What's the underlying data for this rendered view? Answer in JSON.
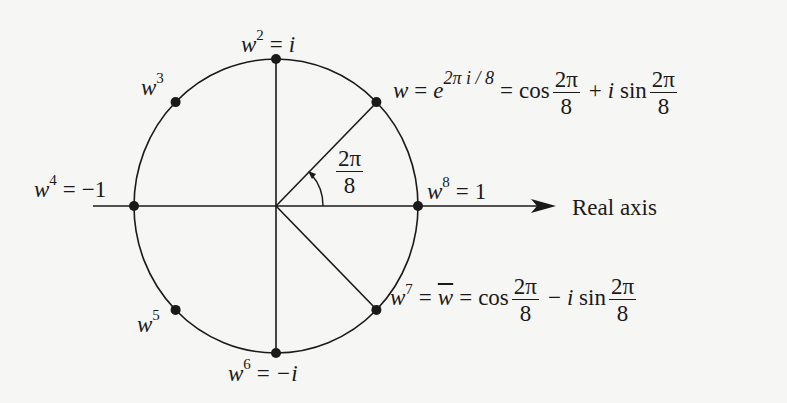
{
  "diagram": {
    "axis_label": "Real axis",
    "angle_label": {
      "num": "2π",
      "den": "8"
    },
    "points": [
      {
        "id": "w8",
        "k": 8,
        "base": "w",
        "exp": "8",
        "value": "1"
      },
      {
        "id": "w1",
        "k": 1,
        "base": "w",
        "exp": "",
        "value": "e",
        "value_exp": "2π i / 8"
      },
      {
        "id": "w2",
        "k": 2,
        "base": "w",
        "exp": "2",
        "value": "i"
      },
      {
        "id": "w3",
        "k": 3,
        "base": "w",
        "exp": "3",
        "value": ""
      },
      {
        "id": "w4",
        "k": 4,
        "base": "w",
        "exp": "4",
        "value": "−1"
      },
      {
        "id": "w5",
        "k": 5,
        "base": "w",
        "exp": "5",
        "value": ""
      },
      {
        "id": "w6",
        "k": 6,
        "base": "w",
        "exp": "6",
        "value": "−i"
      },
      {
        "id": "w7",
        "k": 7,
        "base": "w",
        "exp": "7",
        "value": "w̅"
      }
    ],
    "labels": {
      "w2": {
        "base": "w",
        "exp": "2",
        "eq": "=",
        "rhs": "i"
      },
      "w3": {
        "base": "w",
        "exp": "3"
      },
      "w4": {
        "base": "w",
        "exp": "4",
        "eq": "=",
        "rhs": "−1"
      },
      "w5": {
        "base": "w",
        "exp": "5"
      },
      "w6": {
        "base": "w",
        "exp": "6",
        "eq": "=",
        "rhs": "−i"
      },
      "w8": {
        "base": "w",
        "exp": "8",
        "eq": "=",
        "rhs": "1"
      },
      "w1": {
        "base": "w",
        "eq": "=",
        "e": "e",
        "e_exp": "2π i / 8",
        "eq2": "=",
        "cos": "cos",
        "frac_num": "2π",
        "frac_den": "8",
        "op": "+",
        "i": "i",
        "sin": "sin"
      },
      "w7": {
        "base": "w",
        "exp": "7",
        "eq": "=",
        "conj": "w",
        "eq2": "=",
        "cos": "cos",
        "frac_num": "2π",
        "frac_den": "8",
        "op": "−",
        "i": "i",
        "sin": "sin"
      }
    }
  }
}
